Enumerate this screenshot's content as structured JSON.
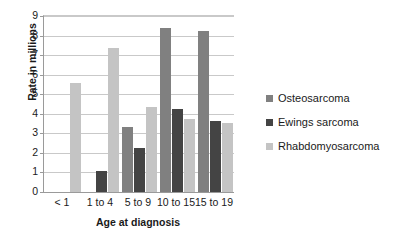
{
  "chart_data": {
    "type": "bar",
    "title": "",
    "subtitle": "",
    "xlabel": "Age at diagnosis",
    "ylabel": "Rate in millions",
    "categories": [
      "< 1",
      "1 to 4",
      "5 to 9",
      "10 to 15",
      "15 to 19"
    ],
    "series": [
      {
        "name": "Osteosarcoma",
        "color": "#808080",
        "values": [
          0,
          0,
          3.35,
          8.4,
          8.25
        ]
      },
      {
        "name": "Ewings sarcoma",
        "color": "#444444",
        "values": [
          0,
          1.1,
          2.25,
          4.25,
          3.65
        ]
      },
      {
        "name": "Rhabdomyosarcoma",
        "color": "#c4c4c4",
        "values": [
          5.55,
          7.35,
          4.35,
          3.75,
          3.55
        ]
      }
    ],
    "ylim": [
      0,
      9
    ],
    "y_ticks": [
      "0",
      "1",
      "2",
      "3",
      "4",
      "5",
      "6",
      "7",
      "8",
      "9"
    ],
    "grid": true,
    "legend_position": "right",
    "gridline_color": "#c9c9c9",
    "axis_color": "#9a9a9a",
    "background_color": "#ffffff"
  },
  "legend": {
    "entries": [
      {
        "label": "Osteosarcoma",
        "swatch_name": "legend-swatch-osteosarcoma"
      },
      {
        "label": "Ewings sarcoma",
        "swatch_name": "legend-swatch-ewings-sarcoma"
      },
      {
        "label": "Rhabdomyosarcoma",
        "swatch_name": "legend-swatch-rhabdomyosarcoma"
      }
    ]
  }
}
